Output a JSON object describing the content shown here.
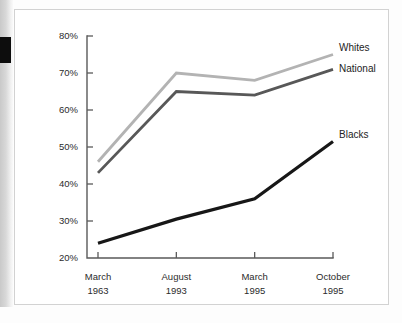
{
  "chart_data": {
    "type": "line",
    "title": "",
    "subtitle": "",
    "xlabel": "",
    "ylabel": "",
    "categories": [
      "March\n1963",
      "August\n1993",
      "March\n1995",
      "October\n1995"
    ],
    "category_lines": [
      {
        "month": "March",
        "year": "1963"
      },
      {
        "month": "August",
        "year": "1993"
      },
      {
        "month": "March",
        "year": "1995"
      },
      {
        "month": "October",
        "year": "1995"
      }
    ],
    "ylim": [
      20,
      80
    ],
    "ytick_values": [
      20,
      30,
      40,
      50,
      60,
      70,
      80
    ],
    "ytick_labels": [
      "20%",
      "30%",
      "40%",
      "50%",
      "60%",
      "70%",
      "80%"
    ],
    "grid": false,
    "legend_position": "inline-right",
    "series": [
      {
        "name": "Whites",
        "color": "#b3b3b3",
        "values": [
          46,
          70,
          68,
          75
        ],
        "label": "Whites"
      },
      {
        "name": "National",
        "color": "#585858",
        "values": [
          43,
          65,
          64,
          71
        ],
        "label": "National"
      },
      {
        "name": "Blacks",
        "color": "#171717",
        "values": [
          24,
          30.5,
          36,
          51.5
        ],
        "label": "Blacks"
      }
    ]
  },
  "axis": {
    "y_top_label": "80%",
    "y_bottom_label": "20%"
  }
}
